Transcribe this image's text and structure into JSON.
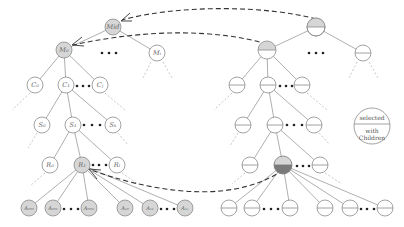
{
  "diagram": {
    "left_tree": {
      "root": {
        "label": "Mid",
        "selected": true
      },
      "level1": [
        {
          "label": "M₀",
          "selected": true
        },
        {
          "label": "Mᵢ",
          "selected": false
        }
      ],
      "level2": [
        {
          "label": "C₀",
          "selected": false
        },
        {
          "label": "C₁",
          "selected": false
        },
        {
          "label": "Cⱼ",
          "selected": false
        }
      ],
      "level3": [
        {
          "label": "S₀",
          "selected": false
        },
        {
          "label": "S₁",
          "selected": false
        },
        {
          "label": "Sₖ",
          "selected": false
        }
      ],
      "level4": [
        {
          "label": "R₀",
          "selected": false
        },
        {
          "label": "R₁",
          "selected": true
        },
        {
          "label": "Rₗ",
          "selected": false
        }
      ],
      "leaves": [
        {
          "label": "A₀₀₀",
          "selected": true
        },
        {
          "label": "A₀₀₁",
          "selected": true
        },
        {
          "label": "A₀₀ₘ",
          "selected": true
        },
        {
          "label": "Aₙ₀",
          "selected": true
        },
        {
          "label": "Aₙ₁",
          "selected": true
        },
        {
          "label": "Aₙₒ",
          "selected": true
        }
      ]
    },
    "right_tree": {
      "root": {
        "state": "selected"
      },
      "level1": [
        {
          "state": "selected"
        },
        {
          "state": "plain"
        }
      ],
      "level2": [
        {
          "state": "plain"
        },
        {
          "state": "plain"
        },
        {
          "state": "plain"
        }
      ],
      "level3": [
        {
          "state": "plain"
        },
        {
          "state": "plain"
        },
        {
          "state": "plain"
        }
      ],
      "level4": [
        {
          "state": "selected-with-children"
        },
        {
          "state": "plain"
        },
        {
          "state": "plain"
        }
      ],
      "leaves": [
        {
          "state": "plain"
        },
        {
          "state": "plain"
        },
        {
          "state": "plain"
        },
        {
          "state": "plain"
        },
        {
          "state": "plain"
        },
        {
          "state": "plain"
        }
      ]
    },
    "legend": {
      "top_text": "selected",
      "bottom_line1": "with",
      "bottom_line2": "Children"
    },
    "colors": {
      "selected_fill": "#d6d6d6",
      "with_children_fill": "#7a7a7a",
      "node_stroke": "#8c8c8c",
      "arrow": "#333333"
    }
  }
}
